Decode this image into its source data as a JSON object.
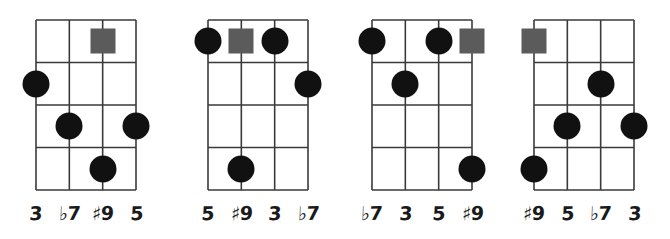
{
  "page": {
    "kind": "guitar-chord-voicing-diagrams",
    "background_color": "#ffffff",
    "width": 670,
    "height": 239
  },
  "style": {
    "grid_line_color": "#3a3a3a",
    "dot_color": "#111111",
    "square_color": "#5b5b5b",
    "label_color": "#1a1a1a",
    "dot_diameter": 27,
    "square_size": 25,
    "strings": 4,
    "frets": 4
  },
  "diagrams": [
    {
      "name": "voicing-1",
      "origin_x": 36,
      "origin_y": 20,
      "grid_width": 100,
      "grid_height": 170,
      "labels": [
        {
          "text": "3",
          "accidental": "",
          "number": "3"
        },
        {
          "text": "♭7",
          "accidental": "♭",
          "number": "7"
        },
        {
          "text": "♯9",
          "accidental": "♯",
          "number": "9"
        },
        {
          "text": "5",
          "accidental": "",
          "number": "5"
        }
      ],
      "markers": [
        {
          "shape": "square",
          "string": 3,
          "fret": 1,
          "interval": "♯9"
        },
        {
          "shape": "dot",
          "string": 1,
          "fret": 2,
          "interval": "3"
        },
        {
          "shape": "dot",
          "string": 2,
          "fret": 3,
          "interval": "♭7"
        },
        {
          "shape": "dot",
          "string": 4,
          "fret": 3,
          "interval": "5"
        },
        {
          "shape": "dot",
          "string": 3,
          "fret": 4,
          "interval": "♯9"
        }
      ]
    },
    {
      "name": "voicing-2",
      "origin_x": 208,
      "origin_y": 20,
      "grid_width": 100,
      "grid_height": 170,
      "labels": [
        {
          "text": "5",
          "accidental": "",
          "number": "5"
        },
        {
          "text": "♯9",
          "accidental": "♯",
          "number": "9"
        },
        {
          "text": "3",
          "accidental": "",
          "number": "3"
        },
        {
          "text": "♭7",
          "accidental": "♭",
          "number": "7"
        }
      ],
      "markers": [
        {
          "shape": "dot",
          "string": 1,
          "fret": 1,
          "interval": "5"
        },
        {
          "shape": "square",
          "string": 2,
          "fret": 1,
          "interval": "♯9"
        },
        {
          "shape": "dot",
          "string": 3,
          "fret": 1,
          "interval": "3"
        },
        {
          "shape": "dot",
          "string": 4,
          "fret": 2,
          "interval": "♭7"
        },
        {
          "shape": "dot",
          "string": 2,
          "fret": 4,
          "interval": "♯9"
        }
      ]
    },
    {
      "name": "voicing-3",
      "origin_x": 372,
      "origin_y": 20,
      "grid_width": 100,
      "grid_height": 170,
      "labels": [
        {
          "text": "♭7",
          "accidental": "♭",
          "number": "7"
        },
        {
          "text": "3",
          "accidental": "",
          "number": "3"
        },
        {
          "text": "5",
          "accidental": "",
          "number": "5"
        },
        {
          "text": "♯9",
          "accidental": "♯",
          "number": "9"
        }
      ],
      "markers": [
        {
          "shape": "dot",
          "string": 1,
          "fret": 1,
          "interval": "♭7"
        },
        {
          "shape": "dot",
          "string": 3,
          "fret": 1,
          "interval": "5"
        },
        {
          "shape": "square",
          "string": 4,
          "fret": 1,
          "interval": "♯9"
        },
        {
          "shape": "dot",
          "string": 2,
          "fret": 2,
          "interval": "3"
        },
        {
          "shape": "dot",
          "string": 4,
          "fret": 4,
          "interval": "♯9"
        }
      ]
    },
    {
      "name": "voicing-4",
      "origin_x": 534,
      "origin_y": 20,
      "grid_width": 100,
      "grid_height": 170,
      "labels": [
        {
          "text": "♯9",
          "accidental": "♯",
          "number": "9"
        },
        {
          "text": "5",
          "accidental": "",
          "number": "5"
        },
        {
          "text": "♭7",
          "accidental": "♭",
          "number": "7"
        },
        {
          "text": "3",
          "accidental": "",
          "number": "3"
        }
      ],
      "markers": [
        {
          "shape": "square",
          "string": 1,
          "fret": 1,
          "interval": "♯9"
        },
        {
          "shape": "dot",
          "string": 3,
          "fret": 2,
          "interval": "♭7"
        },
        {
          "shape": "dot",
          "string": 2,
          "fret": 3,
          "interval": "5"
        },
        {
          "shape": "dot",
          "string": 4,
          "fret": 3,
          "interval": "3"
        },
        {
          "shape": "dot",
          "string": 1,
          "fret": 4,
          "interval": "♯9"
        }
      ]
    }
  ]
}
